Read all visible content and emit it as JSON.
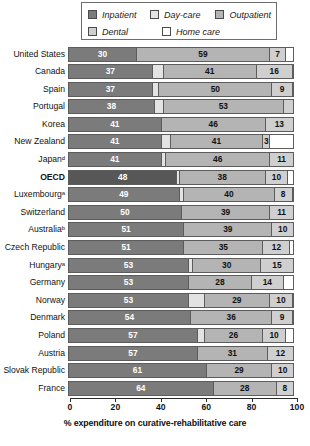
{
  "legend": {
    "items": [
      {
        "label": "Inpatient",
        "key": "inpatient",
        "color": "#7b7b7b",
        "icon": "legend-swatch-inpatient"
      },
      {
        "label": "Day-care",
        "key": "daycare",
        "color": "#e3e3e3",
        "icon": "legend-swatch-daycare"
      },
      {
        "label": "Outpatient",
        "key": "outpatient",
        "color": "#b4b4b4",
        "icon": "legend-swatch-outpatient"
      },
      {
        "label": "Dental",
        "key": "dental",
        "color": "#cfcfcf",
        "icon": "legend-swatch-dental"
      },
      {
        "label": "Home care",
        "key": "homecare",
        "color": "#ffffff",
        "icon": "legend-swatch-homecare"
      }
    ]
  },
  "axis": {
    "ticks": [
      "0",
      "20",
      "40",
      "60",
      "80",
      "100"
    ],
    "tick_values": [
      0,
      20,
      40,
      60,
      80,
      100
    ],
    "title": "% expenditure on curative-rehabilitative care"
  },
  "chart_data": {
    "type": "bar",
    "orientation": "horizontal",
    "stacked": true,
    "title": "",
    "xlabel": "% expenditure on curative-rehabilitative care",
    "ylabel": "",
    "xlim": [
      0,
      100
    ],
    "grid": false,
    "legend_position": "top",
    "series": [
      {
        "name": "Inpatient",
        "values": [
          30,
          37,
          37,
          38,
          41,
          41,
          41,
          48,
          49,
          50,
          51,
          51,
          53,
          53,
          53,
          54,
          57,
          57,
          61,
          64
        ]
      },
      {
        "name": "Day-care",
        "values": [
          0,
          5,
          3,
          4,
          0,
          4,
          2,
          1,
          2,
          0,
          0,
          0,
          2,
          0,
          7,
          0,
          3,
          0,
          0,
          0
        ]
      },
      {
        "name": "Outpatient",
        "values": [
          59,
          41,
          50,
          53,
          46,
          41,
          46,
          38,
          40,
          39,
          39,
          35,
          30,
          28,
          29,
          36,
          26,
          31,
          29,
          28
        ]
      },
      {
        "name": "Dental",
        "values": [
          7,
          16,
          9,
          0,
          13,
          3,
          11,
          10,
          8,
          11,
          10,
          12,
          15,
          14,
          10,
          9,
          10,
          12,
          10,
          8
        ]
      },
      {
        "name": "Home care",
        "values": [
          4,
          1,
          1,
          5,
          0,
          11,
          0,
          3,
          1,
          0,
          0,
          2,
          0,
          5,
          1,
          1,
          4,
          0,
          0,
          0
        ]
      }
    ],
    "categories": [
      "United States",
      "Canada",
      "Spain",
      "Portugal",
      "Korea",
      "New Zealand",
      "Japanᵈ",
      "OECD",
      "Luxembourgᵃ",
      "Switzerland",
      "Australiaᵇ",
      "Czech Republic",
      "Hungaryᵃ",
      "Germany",
      "Norway",
      "Denmark",
      "Poland",
      "Austria",
      "Slovak Republic",
      "France"
    ]
  },
  "rows": [
    {
      "label": "United States",
      "highlight": false,
      "segments": [
        {
          "type": "inpatient",
          "value": 30,
          "show": true
        },
        {
          "type": "outpatient",
          "value": 59,
          "show": true
        },
        {
          "type": "dental",
          "value": 7,
          "show": true
        },
        {
          "type": "homecare",
          "value": 4,
          "show": false
        }
      ]
    },
    {
      "label": "Canada",
      "highlight": false,
      "segments": [
        {
          "type": "inpatient",
          "value": 37,
          "show": true
        },
        {
          "type": "daycare",
          "value": 5,
          "show": false
        },
        {
          "type": "outpatient",
          "value": 41,
          "show": true
        },
        {
          "type": "dental",
          "value": 16,
          "show": true
        },
        {
          "type": "homecare",
          "value": 1,
          "show": false
        }
      ]
    },
    {
      "label": "Spain",
      "highlight": false,
      "segments": [
        {
          "type": "inpatient",
          "value": 37,
          "show": true
        },
        {
          "type": "daycare",
          "value": 3,
          "show": false
        },
        {
          "type": "outpatient",
          "value": 50,
          "show": true
        },
        {
          "type": "dental",
          "value": 9,
          "show": true
        },
        {
          "type": "homecare",
          "value": 1,
          "show": false
        }
      ]
    },
    {
      "label": "Portugal",
      "highlight": false,
      "segments": [
        {
          "type": "inpatient",
          "value": 38,
          "show": true
        },
        {
          "type": "daycare",
          "value": 4,
          "show": false
        },
        {
          "type": "outpatient",
          "value": 53,
          "show": true
        },
        {
          "type": "dental",
          "value": 5,
          "show": false
        }
      ]
    },
    {
      "label": "Korea",
      "highlight": false,
      "segments": [
        {
          "type": "inpatient",
          "value": 41,
          "show": true
        },
        {
          "type": "outpatient",
          "value": 46,
          "show": true
        },
        {
          "type": "dental",
          "value": 13,
          "show": true
        }
      ]
    },
    {
      "label": "New Zealand",
      "highlight": false,
      "segments": [
        {
          "type": "inpatient",
          "value": 41,
          "show": true
        },
        {
          "type": "daycare",
          "value": 4,
          "show": false
        },
        {
          "type": "outpatient",
          "value": 41,
          "show": true
        },
        {
          "type": "dental",
          "value": 3,
          "show": true
        },
        {
          "type": "homecare",
          "value": 11,
          "show": false
        }
      ]
    },
    {
      "label": "Japanᵈ",
      "highlight": false,
      "segments": [
        {
          "type": "inpatient",
          "value": 41,
          "show": true
        },
        {
          "type": "daycare",
          "value": 2,
          "show": false
        },
        {
          "type": "outpatient",
          "value": 46,
          "show": true
        },
        {
          "type": "dental",
          "value": 11,
          "show": true
        }
      ]
    },
    {
      "label": "OECD",
      "highlight": true,
      "segments": [
        {
          "type": "inpatient",
          "value": 48,
          "show": true
        },
        {
          "type": "daycare",
          "value": 1,
          "show": false
        },
        {
          "type": "outpatient",
          "value": 38,
          "show": true
        },
        {
          "type": "dental",
          "value": 10,
          "show": true
        },
        {
          "type": "homecare",
          "value": 3,
          "show": false
        }
      ]
    },
    {
      "label": "Luxembourgᵃ",
      "highlight": false,
      "segments": [
        {
          "type": "inpatient",
          "value": 49,
          "show": true
        },
        {
          "type": "daycare",
          "value": 2,
          "show": false
        },
        {
          "type": "outpatient",
          "value": 40,
          "show": true
        },
        {
          "type": "dental",
          "value": 8,
          "show": true
        },
        {
          "type": "homecare",
          "value": 1,
          "show": false
        }
      ]
    },
    {
      "label": "Switzerland",
      "highlight": false,
      "segments": [
        {
          "type": "inpatient",
          "value": 50,
          "show": true
        },
        {
          "type": "outpatient",
          "value": 39,
          "show": true
        },
        {
          "type": "dental",
          "value": 11,
          "show": true
        }
      ]
    },
    {
      "label": "Australiaᵇ",
      "highlight": false,
      "segments": [
        {
          "type": "inpatient",
          "value": 51,
          "show": true
        },
        {
          "type": "outpatient",
          "value": 39,
          "show": true
        },
        {
          "type": "dental",
          "value": 10,
          "show": true
        }
      ]
    },
    {
      "label": "Czech Republic",
      "highlight": false,
      "segments": [
        {
          "type": "inpatient",
          "value": 51,
          "show": true
        },
        {
          "type": "outpatient",
          "value": 35,
          "show": true
        },
        {
          "type": "dental",
          "value": 12,
          "show": true
        },
        {
          "type": "homecare",
          "value": 2,
          "show": false
        }
      ]
    },
    {
      "label": "Hungaryᵃ",
      "highlight": false,
      "segments": [
        {
          "type": "inpatient",
          "value": 53,
          "show": true
        },
        {
          "type": "daycare",
          "value": 2,
          "show": false
        },
        {
          "type": "outpatient",
          "value": 30,
          "show": true
        },
        {
          "type": "dental",
          "value": 15,
          "show": true
        }
      ]
    },
    {
      "label": "Germany",
      "highlight": false,
      "segments": [
        {
          "type": "inpatient",
          "value": 53,
          "show": true
        },
        {
          "type": "outpatient",
          "value": 28,
          "show": true
        },
        {
          "type": "dental",
          "value": 14,
          "show": true
        },
        {
          "type": "homecare",
          "value": 5,
          "show": false
        }
      ]
    },
    {
      "label": "Norway",
      "highlight": false,
      "segments": [
        {
          "type": "inpatient",
          "value": 53,
          "show": true
        },
        {
          "type": "daycare",
          "value": 7,
          "show": false
        },
        {
          "type": "outpatient",
          "value": 29,
          "show": true
        },
        {
          "type": "dental",
          "value": 10,
          "show": true
        },
        {
          "type": "homecare",
          "value": 1,
          "show": false
        }
      ]
    },
    {
      "label": "Denmark",
      "highlight": false,
      "segments": [
        {
          "type": "inpatient",
          "value": 54,
          "show": true
        },
        {
          "type": "outpatient",
          "value": 36,
          "show": true
        },
        {
          "type": "dental",
          "value": 9,
          "show": true
        },
        {
          "type": "homecare",
          "value": 1,
          "show": false
        }
      ]
    },
    {
      "label": "Poland",
      "highlight": false,
      "segments": [
        {
          "type": "inpatient",
          "value": 57,
          "show": true
        },
        {
          "type": "daycare",
          "value": 3,
          "show": false
        },
        {
          "type": "outpatient",
          "value": 26,
          "show": true
        },
        {
          "type": "dental",
          "value": 10,
          "show": true
        },
        {
          "type": "homecare",
          "value": 4,
          "show": false
        }
      ]
    },
    {
      "label": "Austria",
      "highlight": false,
      "segments": [
        {
          "type": "inpatient",
          "value": 57,
          "show": true
        },
        {
          "type": "outpatient",
          "value": 31,
          "show": true
        },
        {
          "type": "dental",
          "value": 12,
          "show": true
        }
      ]
    },
    {
      "label": "Slovak Republic",
      "highlight": false,
      "segments": [
        {
          "type": "inpatient",
          "value": 61,
          "show": true
        },
        {
          "type": "outpatient",
          "value": 29,
          "show": true
        },
        {
          "type": "dental",
          "value": 10,
          "show": true
        }
      ]
    },
    {
      "label": "France",
      "highlight": false,
      "segments": [
        {
          "type": "inpatient",
          "value": 64,
          "show": true
        },
        {
          "type": "outpatient",
          "value": 28,
          "show": true
        },
        {
          "type": "dental",
          "value": 8,
          "show": true
        }
      ]
    }
  ]
}
